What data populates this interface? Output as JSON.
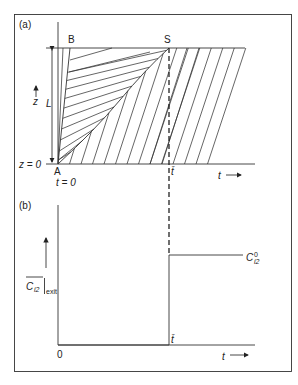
{
  "figure": {
    "panel_a": {
      "label": "(a)",
      "point_labels": {
        "A": "A",
        "B": "B",
        "S": "S"
      },
      "z_axis_label": "z",
      "length_label": "L",
      "z_zero_label": "z = 0",
      "t_zero_label": "t = 0",
      "t_bar_label": "t̄",
      "t_axis_label": "t"
    },
    "panel_b": {
      "label": "(b)",
      "y_axis_label_main": "C",
      "y_axis_label_sub": "i2",
      "y_axis_label_exit": "exit",
      "origin_label": "0",
      "t_bar_label": "t̄",
      "t_axis_label": "t",
      "level_label_main": "C",
      "level_label_sup": "0",
      "level_label_sub": "i2"
    },
    "breakthrough": {
      "description": "step change in exit concentration at t̄",
      "value_before": 0,
      "value_after_label": "C0_i2"
    }
  }
}
